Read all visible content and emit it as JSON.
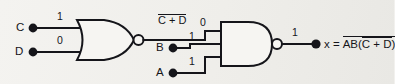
{
  "diagram": {
    "background_color": "#f1f0ed",
    "line_color": "#15151a"
  },
  "inputs": [
    {
      "name": "C",
      "value": "1",
      "node": "input-node-c"
    },
    {
      "name": "D",
      "value": "0",
      "node": "input-node-d"
    },
    {
      "name": "B",
      "value": "1",
      "node": "input-node-b"
    },
    {
      "name": "A",
      "value": "1",
      "node": "input-node-a"
    }
  ],
  "gates": [
    {
      "id": "nor-gate-1",
      "type": "NOR",
      "inputs": [
        "C",
        "D"
      ],
      "output_expression": "C + D",
      "output_expression_bar": true,
      "output_value": "0"
    },
    {
      "id": "nand-gate-1",
      "type": "NAND",
      "inputs": [
        "nor-gate-1",
        "B",
        "A"
      ],
      "output_value": "1"
    }
  ],
  "labels": {
    "nor_output_expr_body": "C + D",
    "nor_output_value": "0",
    "nand_output_value": "1",
    "output_prefix": "x =",
    "output_outer_lead": "AB(",
    "output_inner": "C + D",
    "output_outer_tail": ")"
  },
  "output": {
    "name": "x",
    "expression": "x = AB(C + D)  [complemented]",
    "value": "1",
    "node": "output-node-x"
  }
}
